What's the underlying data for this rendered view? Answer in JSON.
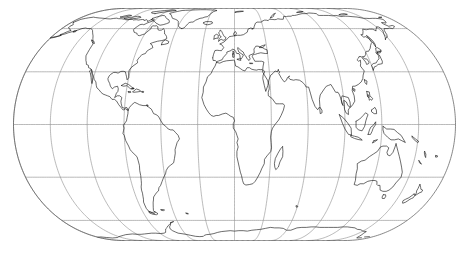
{
  "figure": {
    "kind": "map",
    "width": 469,
    "height": 255
  },
  "map": {
    "projection_name": "Eckert IV",
    "projection_family": "pseudocylindrical equal-area",
    "central_meridian": 10,
    "background_color": "#ffffff",
    "coastline_color": "#111111",
    "graticule_color": "#8c8c8c",
    "outline_color": "#555555",
    "graticule": {
      "meridian_interval_degrees": 30,
      "parallel_interval_degrees": 30,
      "meridians": [
        -170,
        -140,
        -110,
        -80,
        -50,
        -20,
        10,
        40,
        70,
        100,
        130,
        160
      ],
      "parallels": [
        -60,
        -30,
        0,
        30,
        60
      ],
      "pole_line_top_latitude": 90,
      "pole_line_bottom_latitude": -90,
      "show_labels": false
    },
    "extent": {
      "lon_min": -170,
      "lon_max": 190,
      "lat_min": -90,
      "lat_max": 90
    },
    "pixel_frame": {
      "center_x": 234.5,
      "center_y": 124.5,
      "equator_half_width": 221,
      "pole_half_width": 117,
      "pole_half_height": 116,
      "equator_y": 124.5,
      "north_pole_y": 8.5,
      "south_pole_y": 240.5
    },
    "features": [
      "North America",
      "South America",
      "Greenland",
      "Europe",
      "Africa",
      "Asia",
      "Australia",
      "New Zealand",
      "Antarctica",
      "Madagascar",
      "Japan",
      "Indonesia",
      "British Isles",
      "Iceland"
    ]
  },
  "chart_data": {
    "type": "map",
    "xlabel": "Longitude",
    "ylabel": "Latitude",
    "projection": "Eckert IV",
    "central_meridian": 10,
    "xlim": [
      -170,
      190
    ],
    "ylim": [
      -90,
      90
    ],
    "grid": true,
    "legend": "none",
    "meridian_ticks": [
      -170,
      -140,
      -110,
      -80,
      -50,
      -20,
      10,
      40,
      70,
      100,
      130,
      160
    ],
    "parallel_ticks": [
      -90,
      -60,
      -30,
      0,
      30,
      60,
      90
    ]
  }
}
